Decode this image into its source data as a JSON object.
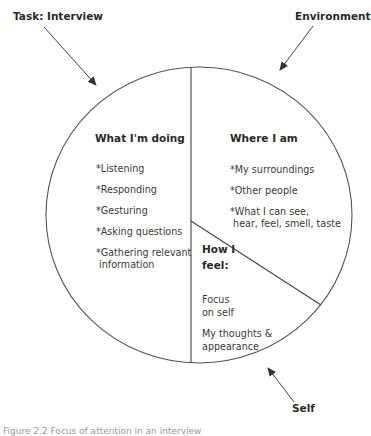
{
  "external_labels": {
    "task": "Task: Interview",
    "environment": "Environment",
    "self": "Self"
  },
  "segments": {
    "doing": {
      "title": "What I'm doing",
      "items": [
        "*Listening",
        "*Responding",
        "*Gesturing",
        "*Asking questions",
        "*Gathering relevant",
        " information"
      ]
    },
    "where": {
      "title": "Where I am",
      "items": [
        "*My surroundings",
        "*Other people",
        "*What I can see,",
        " hear, feel, smell, taste"
      ]
    },
    "feel": {
      "title_line1": "How I",
      "title_line2": "feel:",
      "items": [
        "Focus",
        "on self",
        "My thoughts &",
        "appearance"
      ]
    }
  },
  "caption": "Figure 2.2 Focus of attention in an interview",
  "colors": {
    "line": "#555555",
    "text": "#2a2a2a"
  }
}
